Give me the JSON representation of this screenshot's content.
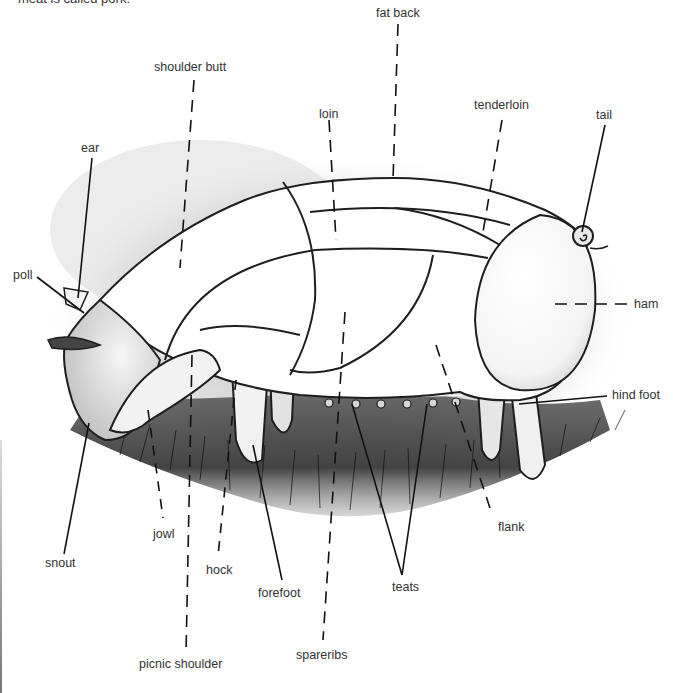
{
  "caption": "meat is called pork.",
  "diagram": {
    "labels": [
      {
        "id": "fat-back",
        "text": "fat back",
        "x": 376,
        "y": 6,
        "leader": "dashed"
      },
      {
        "id": "shoulder-butt",
        "text": "shoulder butt",
        "x": 154,
        "y": 60,
        "leader": "dashed"
      },
      {
        "id": "loin",
        "text": "loin",
        "x": 319,
        "y": 107,
        "leader": "dashed"
      },
      {
        "id": "tenderloin",
        "text": "tenderloin",
        "x": 474,
        "y": 98,
        "leader": "dashed"
      },
      {
        "id": "tail",
        "text": "tail",
        "x": 596,
        "y": 108,
        "leader": "solid"
      },
      {
        "id": "ear",
        "text": "ear",
        "x": 81,
        "y": 141,
        "leader": "solid"
      },
      {
        "id": "poll",
        "text": "poll",
        "x": 13,
        "y": 268,
        "leader": "solid"
      },
      {
        "id": "ham",
        "text": "ham",
        "x": 634,
        "y": 297,
        "leader": "dashed"
      },
      {
        "id": "hind-foot",
        "text": "hind foot",
        "x": 612,
        "y": 388,
        "leader": "solid"
      },
      {
        "id": "flank",
        "text": "flank",
        "x": 498,
        "y": 520,
        "leader": "dashed"
      },
      {
        "id": "jowl",
        "text": "jowl",
        "x": 153,
        "y": 527,
        "leader": "dashed"
      },
      {
        "id": "snout",
        "text": "snout",
        "x": 45,
        "y": 556,
        "leader": "solid"
      },
      {
        "id": "hock",
        "text": "hock",
        "x": 206,
        "y": 563,
        "leader": "dashed"
      },
      {
        "id": "teats",
        "text": "teats",
        "x": 392,
        "y": 580,
        "leader": "solid"
      },
      {
        "id": "forefoot",
        "text": "forefoot",
        "x": 258,
        "y": 586,
        "leader": "solid"
      },
      {
        "id": "spareribs",
        "text": "spareribs",
        "x": 296,
        "y": 648,
        "leader": "dashed"
      },
      {
        "id": "picnic-shoulder",
        "text": "picnic shoulder",
        "x": 139,
        "y": 657,
        "leader": "dashed"
      }
    ]
  }
}
